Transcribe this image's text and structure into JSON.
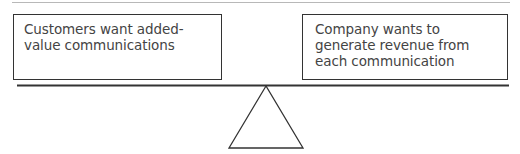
{
  "diagram": {
    "type": "balance-scale",
    "left_box": {
      "text": "Customers want added-value communications",
      "lines": [
        "Customers want added-",
        "value communications"
      ]
    },
    "right_box": {
      "text": "Company wants to generate revenue from each communication",
      "lines": [
        "Company wants to",
        "generate revenue from",
        "each communication"
      ]
    },
    "colors": {
      "stroke": "#333333",
      "text": "#444444",
      "rule": "#b8b8b8"
    }
  }
}
